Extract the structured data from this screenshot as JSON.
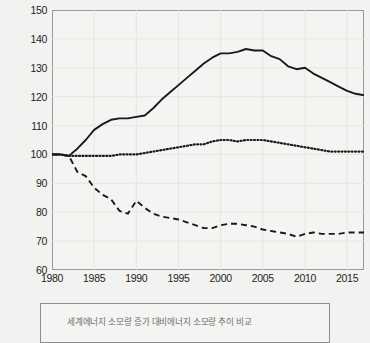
{
  "chart_data": {
    "type": "line",
    "title": "",
    "xlabel": "",
    "ylabel": "지수 (1980=100)",
    "xlim": [
      1980,
      2017
    ],
    "ylim": [
      60,
      150
    ],
    "ytick_labels": [
      "150",
      "140",
      "130",
      "120",
      "110",
      "100",
      "90",
      "80",
      "70",
      "60"
    ],
    "ytick_values": [
      150,
      140,
      130,
      120,
      110,
      100,
      90,
      80,
      70,
      60
    ],
    "xtick_labels": [
      "1980",
      "1985",
      "1990",
      "1995",
      "2000",
      "2005",
      "2010",
      "2015"
    ],
    "xtick_values": [
      1980,
      1985,
      1990,
      1995,
      2000,
      2005,
      2010,
      2015
    ],
    "grid": true,
    "legend_position": "below",
    "x": [
      1980,
      1981,
      1982,
      1983,
      1984,
      1985,
      1986,
      1987,
      1988,
      1989,
      1990,
      1991,
      1992,
      1993,
      1994,
      1995,
      1996,
      1997,
      1998,
      1999,
      2000,
      2001,
      2002,
      2003,
      2004,
      2005,
      2006,
      2007,
      2008,
      2009,
      2010,
      2011,
      2012,
      2013,
      2014,
      2015,
      2016,
      2017
    ],
    "series": [
      {
        "name": "series-solid",
        "style": "solid",
        "color": "#1a1a1a",
        "values": [
          100,
          100,
          99.5,
          102,
          105,
          108.5,
          110.5,
          112,
          112.5,
          112.5,
          113,
          113.5,
          116,
          119,
          121.5,
          124,
          126.5,
          129,
          131.5,
          133.5,
          135,
          135,
          135.5,
          136.5,
          136,
          136,
          134,
          133,
          130.5,
          129.5,
          130,
          128,
          126.5,
          125,
          123.5,
          122,
          121,
          120.5
        ]
      },
      {
        "name": "series-dotted",
        "style": "dotted",
        "color": "#1a1a1a",
        "values": [
          100,
          100,
          99.5,
          99.5,
          99.5,
          99.5,
          99.5,
          99.5,
          100,
          100,
          100,
          100.5,
          101,
          101.5,
          102,
          102.5,
          103,
          103.5,
          103.5,
          104.5,
          105,
          105,
          104.5,
          105,
          105,
          105,
          104.5,
          104,
          103.5,
          103,
          102.5,
          102,
          101.5,
          101,
          101,
          101,
          101,
          101
        ]
      },
      {
        "name": "series-dashed",
        "style": "dashed",
        "color": "#1a1a1a",
        "values": [
          100,
          100,
          99.5,
          94,
          92.5,
          88.5,
          86,
          84.5,
          80.5,
          79.5,
          84,
          81.5,
          79.5,
          78.5,
          78,
          77.5,
          76.5,
          75.5,
          74.5,
          74.5,
          75.5,
          76,
          76,
          75.5,
          75,
          74,
          73.5,
          73,
          72.5,
          71.5,
          72.5,
          73,
          72.5,
          72.5,
          72.5,
          73,
          73,
          73
        ]
      }
    ]
  },
  "legend": {
    "lines": [
      "세계에너지 소모량 증가 대비에너지 소모량 추이 비교",
      ""
    ]
  }
}
